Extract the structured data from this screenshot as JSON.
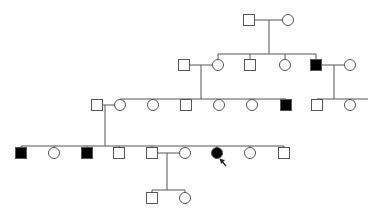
{
  "diagram": {
    "type": "pedigree",
    "colors": {
      "line": "#555555",
      "affected": "#000000",
      "unaffected": "#ffffff"
    },
    "symbol_size": 11,
    "individuals": [
      {
        "id": "I-1",
        "sex": "male",
        "affected": false,
        "x": 249,
        "y": 20
      },
      {
        "id": "I-2",
        "sex": "female",
        "affected": false,
        "x": 288,
        "y": 20
      },
      {
        "id": "II-1",
        "sex": "male",
        "affected": false,
        "x": 184,
        "y": 65
      },
      {
        "id": "II-2",
        "sex": "female",
        "affected": false,
        "x": 218,
        "y": 65
      },
      {
        "id": "II-3",
        "sex": "male",
        "affected": false,
        "x": 250,
        "y": 65
      },
      {
        "id": "II-4",
        "sex": "female",
        "affected": false,
        "x": 285,
        "y": 65
      },
      {
        "id": "II-5",
        "sex": "male",
        "affected": true,
        "x": 316,
        "y": 65
      },
      {
        "id": "II-6",
        "sex": "female",
        "affected": false,
        "x": 350,
        "y": 65
      },
      {
        "id": "III-1",
        "sex": "male",
        "affected": false,
        "x": 97,
        "y": 105
      },
      {
        "id": "III-2",
        "sex": "female",
        "affected": false,
        "x": 120,
        "y": 105
      },
      {
        "id": "III-3",
        "sex": "female",
        "affected": false,
        "x": 153,
        "y": 105
      },
      {
        "id": "III-4",
        "sex": "male",
        "affected": false,
        "x": 186,
        "y": 105
      },
      {
        "id": "III-5",
        "sex": "female",
        "affected": false,
        "x": 219,
        "y": 105
      },
      {
        "id": "III-6",
        "sex": "female",
        "affected": false,
        "x": 252,
        "y": 105
      },
      {
        "id": "III-7",
        "sex": "male",
        "affected": true,
        "x": 286,
        "y": 105
      },
      {
        "id": "III-8",
        "sex": "male",
        "affected": false,
        "x": 317,
        "y": 105
      },
      {
        "id": "III-9",
        "sex": "female",
        "affected": false,
        "x": 350,
        "y": 105
      },
      {
        "id": "IV-1",
        "sex": "male",
        "affected": true,
        "x": 21,
        "y": 153
      },
      {
        "id": "IV-2",
        "sex": "female",
        "affected": false,
        "x": 54,
        "y": 153
      },
      {
        "id": "IV-3",
        "sex": "male",
        "affected": true,
        "x": 87,
        "y": 153
      },
      {
        "id": "IV-4",
        "sex": "male",
        "affected": false,
        "x": 119,
        "y": 153
      },
      {
        "id": "IV-5",
        "sex": "male",
        "affected": false,
        "x": 152,
        "y": 153
      },
      {
        "id": "IV-6",
        "sex": "female",
        "affected": false,
        "x": 185,
        "y": 153
      },
      {
        "id": "IV-7",
        "sex": "female",
        "affected": true,
        "proband": true,
        "x": 217,
        "y": 153
      },
      {
        "id": "IV-8",
        "sex": "female",
        "affected": false,
        "x": 250,
        "y": 153
      },
      {
        "id": "IV-9",
        "sex": "male",
        "affected": false,
        "x": 284,
        "y": 153
      },
      {
        "id": "V-1",
        "sex": "male",
        "affected": false,
        "x": 152,
        "y": 198
      },
      {
        "id": "V-2",
        "sex": "female",
        "affected": false,
        "x": 185,
        "y": 198
      }
    ],
    "lines": [
      [
        254,
        20,
        283,
        20
      ],
      [
        269,
        20,
        269,
        54
      ],
      [
        218,
        54,
        316,
        54
      ],
      [
        218,
        54,
        218,
        60
      ],
      [
        250,
        54,
        250,
        60
      ],
      [
        285,
        54,
        285,
        60
      ],
      [
        316,
        54,
        316,
        60
      ],
      [
        189,
        65,
        213,
        65
      ],
      [
        201,
        65,
        201,
        99
      ],
      [
        321,
        65,
        345,
        65
      ],
      [
        334,
        65,
        334,
        99
      ],
      [
        120,
        99,
        286,
        99
      ],
      [
        120,
        99,
        120,
        100
      ],
      [
        153,
        99,
        153,
        100
      ],
      [
        186,
        99,
        186,
        100
      ],
      [
        219,
        99,
        219,
        100
      ],
      [
        252,
        99,
        252,
        100
      ],
      [
        286,
        99,
        286,
        100
      ],
      [
        317,
        99,
        368,
        99
      ],
      [
        317,
        99,
        317,
        100
      ],
      [
        350,
        99,
        350,
        100
      ],
      [
        102,
        105,
        115,
        105
      ],
      [
        105,
        105,
        105,
        146
      ],
      [
        21,
        146,
        284,
        146
      ],
      [
        21,
        146,
        21,
        148
      ],
      [
        54,
        146,
        54,
        148
      ],
      [
        87,
        146,
        87,
        148
      ],
      [
        119,
        146,
        119,
        148
      ],
      [
        152,
        146,
        152,
        148
      ],
      [
        217,
        146,
        217,
        148
      ],
      [
        250,
        146,
        250,
        148
      ],
      [
        284,
        146,
        284,
        148
      ],
      [
        157,
        153,
        180,
        153
      ],
      [
        167,
        153,
        167,
        190
      ],
      [
        152,
        190,
        185,
        190
      ],
      [
        152,
        190,
        152,
        193
      ],
      [
        185,
        190,
        185,
        193
      ]
    ],
    "proband_arrow": {
      "from": [
        226,
        166
      ],
      "to": [
        220,
        159
      ]
    }
  }
}
